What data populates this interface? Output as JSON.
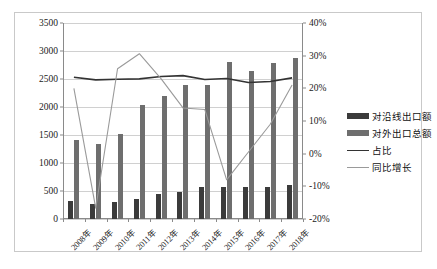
{
  "chart_data": {
    "type": "bar",
    "title": "",
    "xlabel": "",
    "ylabel": "",
    "categories": [
      "2008年",
      "2009年",
      "2010年",
      "2011年",
      "2012年",
      "2013年",
      "2014年",
      "2015年",
      "2016年",
      "2017年",
      "2018年"
    ],
    "left_axis": {
      "ticks": [
        "0",
        "500",
        "1000",
        "1500",
        "2000",
        "2500",
        "3000",
        "3500"
      ],
      "values": [
        0,
        500,
        1000,
        1500,
        2000,
        2500,
        3000,
        3500
      ],
      "min": 0,
      "max": 3500
    },
    "right_axis": {
      "ticks": [
        "-20%",
        "-10%",
        "0%",
        "10%",
        "20%",
        "30%",
        "40%"
      ],
      "values": [
        -20,
        -10,
        0,
        10,
        20,
        30,
        40
      ],
      "min": -20,
      "max": 40
    },
    "grid": true,
    "legend_position": "right",
    "series": [
      {
        "name": "对沿线出口额",
        "kind": "bar",
        "axis": "left",
        "color": "#3b3b3b",
        "values": [
          330,
          275,
          305,
          350,
          455,
          490,
          570,
          580,
          575,
          565,
          600
        ]
      },
      {
        "name": "对外出口总额",
        "kind": "bar",
        "axis": "left",
        "color": "#6e6e6e",
        "values": [
          1410,
          1340,
          1510,
          2040,
          2200,
          2395,
          2390,
          2800,
          2640,
          2780,
          2880
        ]
      },
      {
        "name": "占比",
        "kind": "line",
        "axis": "right",
        "color": "#333333",
        "values": [
          23.4,
          22.6,
          22.8,
          22.9,
          23.6,
          23.9,
          22.7,
          23.0,
          21.8,
          22.1,
          23.2
        ]
      },
      {
        "name": "同比增长",
        "kind": "line",
        "axis": "right",
        "color": "#9a9a9a",
        "values": [
          20.0,
          -16.7,
          26.0,
          30.6,
          22.9,
          14.0,
          13.5,
          -8.0,
          0.5,
          9.0,
          21.0
        ]
      }
    ]
  },
  "legend": {
    "items": [
      {
        "label": "对沿线出口额",
        "type": "bar",
        "color": "#3b3b3b"
      },
      {
        "label": "对外出口总额",
        "type": "bar",
        "color": "#6e6e6e"
      },
      {
        "label": "占比",
        "type": "line",
        "color": "#333333"
      },
      {
        "label": "同比增长",
        "type": "line",
        "color": "#9a9a9a"
      }
    ]
  }
}
